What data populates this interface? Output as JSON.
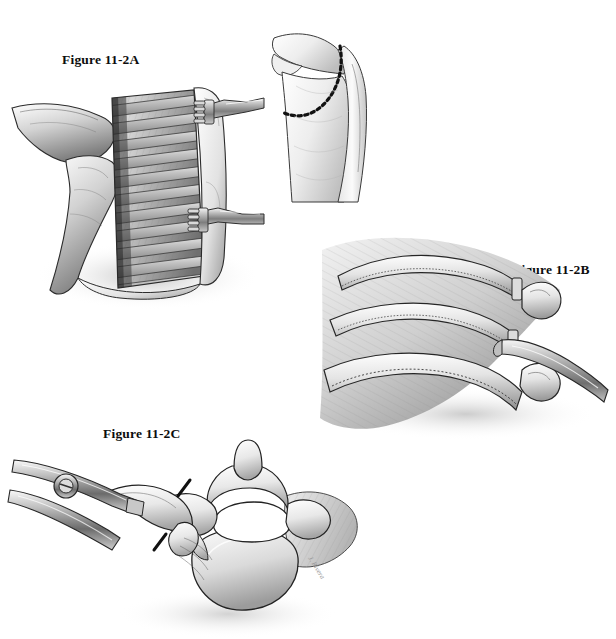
{
  "plate": {
    "title": "Figure 11-2 surgical illustration plate",
    "background_color": "#ffffff",
    "ink_color": "#111111",
    "width": 616,
    "height": 639,
    "style": "grayscale pen-and-ink medical illustration"
  },
  "labels": {
    "a": "Figure 11-2A",
    "b": "Figure 11-2B",
    "c": "Figure 11-2C"
  },
  "panels": {
    "a": {
      "name": "Figure 11-2A",
      "caption_text": "Figure 11-2A",
      "subject": "thoracotomy exposure of the chest wall with ribs and intercostal muscles retracted",
      "elements": [
        "scapula edge",
        "latissimus dorsi muscle flap",
        "exposed ribs",
        "intercostal muscles",
        "rake retractor upper",
        "rake retractor lower",
        "skin edge"
      ],
      "rib_count": 11,
      "retractor_prongs": 4
    },
    "inset": {
      "name": "incision-inset",
      "subject": "posterolateral torso with dashed skin incision line marked over the scapula and chest wall",
      "elements": [
        "shoulder",
        "scapula",
        "arm",
        "chest wall",
        "dashed incision line"
      ],
      "incision_style": "dashed"
    },
    "b": {
      "name": "Figure 11-2B",
      "caption_text": "Figure 11-2B",
      "subject": "subperiosteal rib resection showing divided ribs, rib heads and a periosteal elevator",
      "elements": [
        "rib 1 divided",
        "rib 2 divided",
        "rib 3 with intact periosteum",
        "rib head",
        "costotransverse joint",
        "periosteal elevator",
        "paraspinal muscle"
      ],
      "rib_count": 3,
      "dotted_line_meaning": "periosteal incision"
    },
    "c": {
      "name": "Figure 11-2C",
      "caption_text": "Figure 11-2C",
      "subject": "axial view of a thoracic vertebra with rib being divided by a bone cutter; dashed lines mark the osteotomy cuts",
      "elements": [
        "vertebral body",
        "spinal canal",
        "spinous process",
        "transverse process",
        "pedicle",
        "rib",
        "rib head",
        "bone cutter instrument",
        "pivot screw",
        "osteotomy dashed marks",
        "paraspinal muscle"
      ],
      "osteotomy_marks": 2
    }
  },
  "signature": {
    "text": "J. Rivera",
    "visible": true
  }
}
